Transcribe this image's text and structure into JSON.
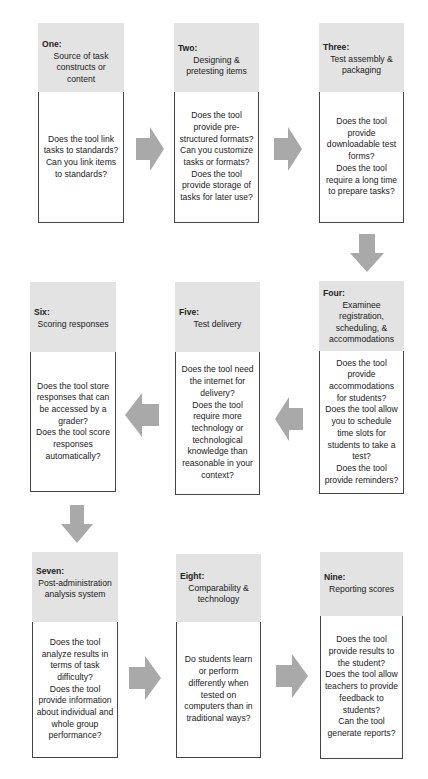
{
  "diagram": {
    "colors": {
      "header_bg": "#e3e3e3",
      "border": "#444444",
      "arrow": "#a9a9a9"
    },
    "steps": [
      {
        "number": "One:",
        "title": "Source of task constructs or content",
        "questions": [
          "Does the tool link tasks to standards?",
          "Can you link items to standards?"
        ]
      },
      {
        "number": "Two:",
        "title": "Designing & pretesting items",
        "questions": [
          "Does the tool provide pre-structured formats?",
          "Can you customize tasks or formats?",
          "Does the tool provide storage of tasks for later use?"
        ]
      },
      {
        "number": "Three:",
        "title": "Test assembly & packaging",
        "questions": [
          "Does the tool provide downloadable test forms?",
          "Does the tool require a long time to prepare tasks?"
        ]
      },
      {
        "number": "Four:",
        "title": "Examinee registration, scheduling, & accommodations",
        "questions": [
          "Does the tool provide accommodations for students?",
          "Does the tool allow you to schedule time slots for students to take a test?",
          "Does the tool provide reminders?"
        ]
      },
      {
        "number": "Five:",
        "title": "Test delivery",
        "questions": [
          "Does the tool need the internet for delivery?",
          "Does the tool require more technology or technological knowledge than reasonable in your context?"
        ]
      },
      {
        "number": "Six:",
        "title": "Scoring responses",
        "questions": [
          "Does the tool store responses that can be accessed by a grader?",
          "Does the tool score responses automatically?"
        ]
      },
      {
        "number": "Seven:",
        "title": "Post-administration analysis system",
        "questions": [
          "Does the tool analyze results in terms of task difficulty?",
          "Does the tool provide information about individual and whole group performance?"
        ]
      },
      {
        "number": "Eight:",
        "title": "Comparability & technology",
        "questions": [
          "Do students learn or perform differently when tested on computers than in traditional ways?"
        ]
      },
      {
        "number": "Nine:",
        "title": "Reporting scores",
        "questions": [
          "Does the tool provide results to the student?",
          "Does the tool allow teachers to provide feedback to students?",
          "Can the tool generate reports?"
        ]
      }
    ],
    "arrows": [
      {
        "from": "One",
        "to": "Two",
        "direction": "right"
      },
      {
        "from": "Two",
        "to": "Three",
        "direction": "right"
      },
      {
        "from": "Three",
        "to": "Four",
        "direction": "down"
      },
      {
        "from": "Four",
        "to": "Five",
        "direction": "left"
      },
      {
        "from": "Five",
        "to": "Six",
        "direction": "left"
      },
      {
        "from": "Six",
        "to": "Seven",
        "direction": "down"
      },
      {
        "from": "Seven",
        "to": "Eight",
        "direction": "right"
      },
      {
        "from": "Eight",
        "to": "Nine",
        "direction": "right"
      }
    ]
  }
}
